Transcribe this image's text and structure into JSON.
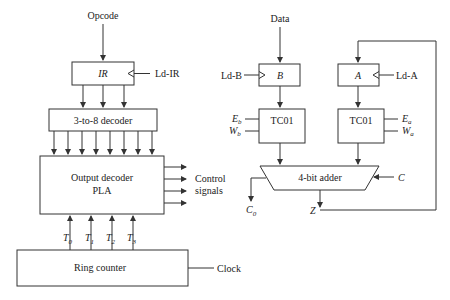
{
  "left": {
    "opcode_label": "Opcode",
    "ir_label": "IR",
    "ld_ir_label": "Ld-IR",
    "decoder_label": "3-to-8 decoder",
    "pla_line1": "Output decoder",
    "pla_line2": "PLA",
    "control_line1": "Control",
    "control_line2": "signals",
    "timing": [
      {
        "base": "T",
        "sub": "0"
      },
      {
        "base": "T",
        "sub": "1"
      },
      {
        "base": "T",
        "sub": "2"
      },
      {
        "base": "T",
        "sub": "3"
      }
    ],
    "ring_counter_label": "Ring counter",
    "clock_label": "Clock"
  },
  "right": {
    "data_label": "Data",
    "reg_b_label": "B",
    "ld_b_label": "Ld-B",
    "reg_a_label": "A",
    "ld_a_label": "Ld-A",
    "tc_b_label": "TC01",
    "tc_a_label": "TC01",
    "eb": {
      "base": "E",
      "sub": "b"
    },
    "wb": {
      "base": "W",
      "sub": "b"
    },
    "ea": {
      "base": "E",
      "sub": "a"
    },
    "wa": {
      "base": "W",
      "sub": "a"
    },
    "adder_label": "4-bit adder",
    "carry_in_label": "C",
    "carry_out": {
      "base": "C",
      "sub": "0"
    },
    "output_label": "Z"
  }
}
